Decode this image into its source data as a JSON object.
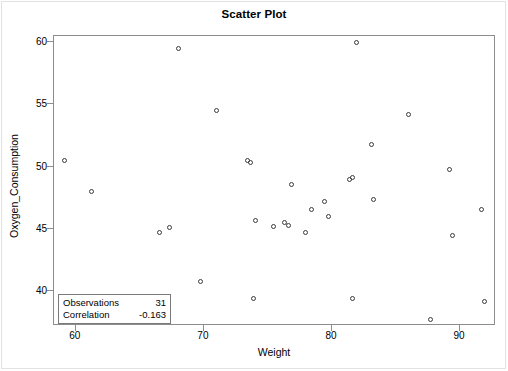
{
  "chart_data": {
    "type": "scatter",
    "title": "Scatter Plot",
    "xlabel": "Weight",
    "ylabel": "Oxygen_Consumption",
    "xlim": [
      58.3,
      92.8
    ],
    "ylim": [
      37.2,
      60.5
    ],
    "xticks": [
      60,
      70,
      80,
      90
    ],
    "yticks": [
      40,
      45,
      50,
      55,
      60
    ],
    "grid": false,
    "legend": "none",
    "marker": "open-circle",
    "marker_color": "#3a3a3a",
    "series": [
      {
        "name": "Oxygen_Consumption vs Weight",
        "points": [
          [
            59.1,
            50.5
          ],
          [
            61.2,
            48.0
          ],
          [
            66.5,
            44.7
          ],
          [
            67.3,
            45.1
          ],
          [
            68.0,
            59.5
          ],
          [
            69.7,
            40.8
          ],
          [
            71.0,
            54.5
          ],
          [
            73.4,
            50.5
          ],
          [
            73.6,
            50.3
          ],
          [
            73.9,
            39.4
          ],
          [
            74.0,
            45.7
          ],
          [
            75.4,
            45.2
          ],
          [
            76.3,
            45.5
          ],
          [
            76.6,
            45.3
          ],
          [
            76.8,
            48.6
          ],
          [
            77.9,
            44.7
          ],
          [
            78.4,
            46.6
          ],
          [
            79.4,
            47.2
          ],
          [
            79.7,
            46.0
          ],
          [
            81.4,
            49.0
          ],
          [
            81.6,
            49.1
          ],
          [
            81.6,
            39.4
          ],
          [
            81.9,
            60.0
          ],
          [
            83.1,
            51.8
          ],
          [
            83.2,
            47.4
          ],
          [
            86.0,
            54.2
          ],
          [
            87.7,
            37.7
          ],
          [
            89.2,
            49.8
          ],
          [
            89.4,
            44.5
          ],
          [
            91.7,
            46.6
          ],
          [
            91.9,
            39.2
          ]
        ]
      }
    ],
    "annotations": {
      "stats_box": {
        "rows": [
          {
            "label": "Observations",
            "value": "31"
          },
          {
            "label": "Correlation",
            "value": "-0.163"
          }
        ]
      }
    }
  }
}
